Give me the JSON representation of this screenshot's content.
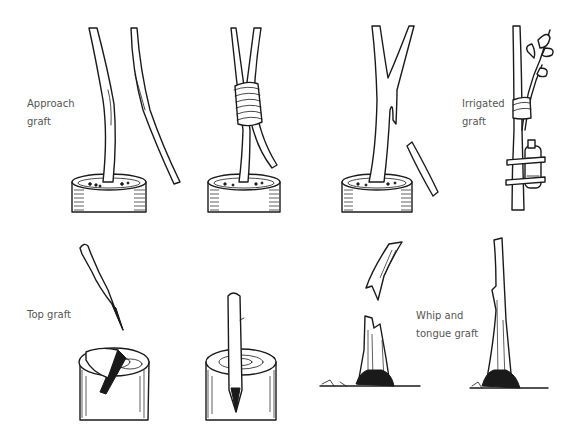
{
  "diagram": {
    "colors": {
      "ink": "#1a1a1a",
      "label": "#555555",
      "background": "#ffffff"
    },
    "labels": [
      {
        "id": "approach",
        "text": "Approach\ngraft",
        "x": 27,
        "y": 95
      },
      {
        "id": "irrigated",
        "text": "Irrigated\ngraft",
        "x": 462,
        "y": 95
      },
      {
        "id": "top",
        "text": "Top graft",
        "x": 27,
        "y": 306
      },
      {
        "id": "whip",
        "text": "Whip and\ntongue graft",
        "x": 416,
        "y": 307
      }
    ],
    "panels": [
      {
        "id": "approach-1",
        "technique": "Approach graft",
        "description": "Potted rootstock beside separate scion stem"
      },
      {
        "id": "approach-2",
        "technique": "Approach graft",
        "description": "Stems bound together with tie"
      },
      {
        "id": "approach-3",
        "technique": "Approach graft",
        "description": "Scion cut free after union"
      },
      {
        "id": "irrigated",
        "technique": "Irrigated graft",
        "description": "Scion tied to stock with water container"
      },
      {
        "id": "top-1",
        "technique": "Top graft",
        "description": "Wedge-cut scion above split stump"
      },
      {
        "id": "top-2",
        "technique": "Top graft",
        "description": "Scion inserted into split stump"
      },
      {
        "id": "whip-1",
        "technique": "Whip and tongue graft",
        "description": "Cut scion above notched stock"
      },
      {
        "id": "whip-2",
        "technique": "Whip and tongue graft",
        "description": "Joined scion and stock"
      }
    ]
  }
}
